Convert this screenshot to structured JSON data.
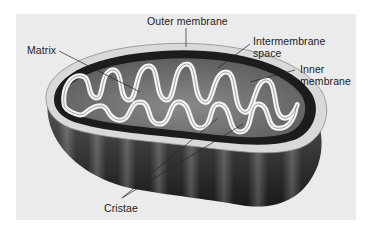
{
  "figure": {
    "background_color": "#ebebeb",
    "labels": {
      "outer_membrane": "Outer membrane",
      "matrix": "Matrix",
      "intermembrane_space_line1": "Intermembrane",
      "intermembrane_space_line2": "space",
      "inner_membrane_line1": "Inner",
      "inner_membrane_line2": "membrane",
      "cristae": "Cristae"
    }
  }
}
